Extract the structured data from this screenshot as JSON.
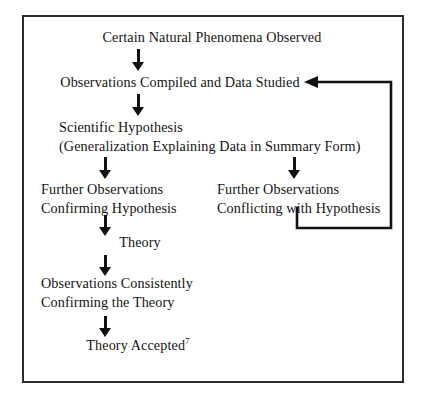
{
  "figure": {
    "type": "flowchart",
    "border_color": "#2c2c2c",
    "ink_color": "#111111",
    "background": "#ffffff"
  },
  "nodes": {
    "phenomena": {
      "line1": "Certain Natural Phenomena Observed"
    },
    "compiled": {
      "line1": "Observations Compiled and Data Studied"
    },
    "hypothesis": {
      "line1": "Scientific Hypothesis",
      "line2": "(Generalization Explaining Data in Summary Form)"
    },
    "confirming": {
      "line1": "Further Observations",
      "line2": "Confirming Hypothesis"
    },
    "conflicting": {
      "line1": "Further Observations",
      "line2": "Conflicting with Hypothesis"
    },
    "theory": {
      "line1": "Theory"
    },
    "consistent": {
      "line1": "Observations Consistently",
      "line2": "Confirming the Theory"
    },
    "accepted": {
      "line1": "Theory Accepted",
      "footnote": "7"
    }
  },
  "connectors": {
    "phenomena_to_compiled": "arrow-down",
    "compiled_to_hypothesis": "arrow-down",
    "hypothesis_to_confirming": "arrow-down",
    "hypothesis_to_conflicting": "arrow-down",
    "confirming_to_theory": "arrow-down",
    "theory_to_consistent": "arrow-down",
    "consistent_to_accepted": "arrow-down",
    "conflicting_to_compiled": "feedback-loop-arrow-left"
  }
}
